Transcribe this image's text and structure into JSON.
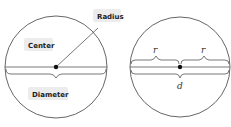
{
  "left_diagram": {
    "labels": {
      "radius": "Radius",
      "center": "Center",
      "diameter": "Diameter"
    }
  },
  "right_diagram": {
    "labels": {
      "r_left": "r",
      "r_right": "r",
      "d": "d"
    }
  },
  "colors": {
    "stroke": "#555555",
    "label_bg": "#ececec",
    "dot": "#111111"
  }
}
